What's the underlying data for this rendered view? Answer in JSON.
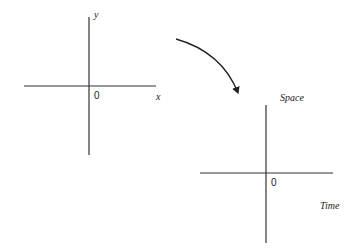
{
  "diagram": {
    "left_axes": {
      "origin_label": "0",
      "x_label": "x",
      "y_label": "y"
    },
    "transform_arrow": {
      "direction": "clockwise-curve-down-right"
    },
    "right_axes": {
      "origin_label": "0",
      "vertical_label": "Space",
      "horizontal_label": "Time"
    },
    "colors": {
      "line": "#333333",
      "background": "#ffffff"
    }
  }
}
